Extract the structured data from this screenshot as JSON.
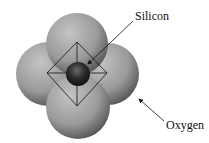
{
  "diagram": {
    "labels": {
      "silicon": "Silicon",
      "oxygen": "Oxygen"
    },
    "atoms": [
      {
        "name": "oxygen-top",
        "element": "Oxygen"
      },
      {
        "name": "oxygen-left",
        "element": "Oxygen"
      },
      {
        "name": "oxygen-right",
        "element": "Oxygen"
      },
      {
        "name": "oxygen-bottom",
        "element": "Oxygen"
      },
      {
        "name": "silicon-center",
        "element": "Silicon"
      }
    ],
    "colors": {
      "sphere_light": "#bdbdbd",
      "sphere_dark": "#4a4a4a",
      "silicon_light": "#6a6a6a",
      "silicon_dark": "#141414",
      "lines": "#111111"
    }
  }
}
